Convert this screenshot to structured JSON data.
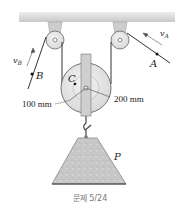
{
  "figure": {
    "caption": "문제 5/24",
    "labels": {
      "point_a": "A",
      "point_b": "B",
      "center_c": "C",
      "load_p": "P",
      "velocity_a": "v",
      "velocity_a_sub": "A",
      "velocity_b": "v",
      "velocity_b_sub": "B"
    },
    "dimensions": {
      "inner_radius": "100 mm",
      "outer_radius": "200 mm"
    },
    "colors": {
      "ceiling": "#d9d9d9",
      "pulley": "#e6e6e6",
      "bracket": "#cfcfcf",
      "rope": "#333333",
      "load": "#c4c4c4"
    }
  }
}
